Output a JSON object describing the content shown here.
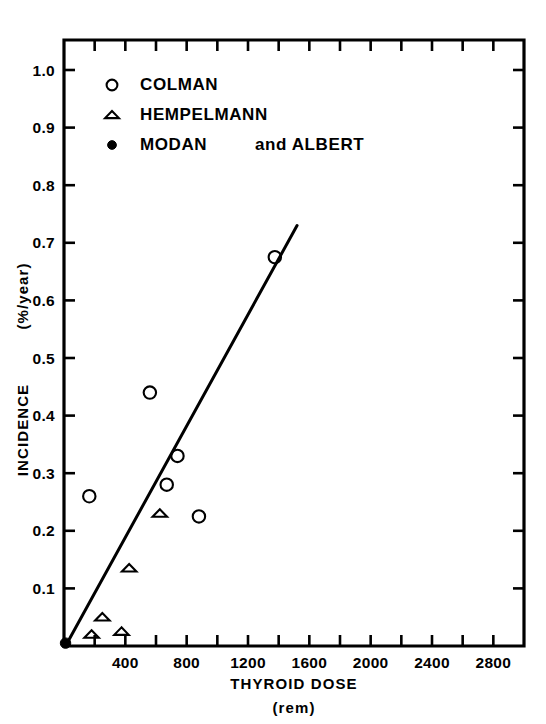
{
  "chart_data": {
    "type": "scatter",
    "title": "",
    "xlabel": "THYROID DOSE",
    "xlabel_units": "(rem)",
    "ylabel": "INCIDENCE",
    "ylabel_units": "(%/year)",
    "xlim": [
      0,
      3000
    ],
    "ylim": [
      0,
      1.05
    ],
    "xticks": [
      0,
      200,
      400,
      600,
      800,
      1000,
      1200,
      1400,
      1600,
      1800,
      2000,
      2200,
      2400,
      2600,
      2800,
      3000
    ],
    "xtick_labels": [
      "400",
      "800",
      "1200",
      "1600",
      "2000",
      "2400",
      "2800"
    ],
    "xtick_label_values": [
      400,
      800,
      1200,
      1600,
      2000,
      2400,
      2800
    ],
    "yticks": [
      0.1,
      0.2,
      0.3,
      0.4,
      0.5,
      0.6,
      0.7,
      0.8,
      0.9,
      1.0
    ],
    "ytick_labels": [
      "0.1",
      "0.2",
      "0.3",
      "0.4",
      "0.5",
      "0.6",
      "0.7",
      "0.8",
      "0.9",
      "1.0"
    ],
    "grid": false,
    "legend_position": "upper-left",
    "series": [
      {
        "name": "COLMAN",
        "marker": "open-circle",
        "points": [
          {
            "x": 165,
            "y": 0.26
          },
          {
            "x": 560,
            "y": 0.44
          },
          {
            "x": 670,
            "y": 0.28
          },
          {
            "x": 740,
            "y": 0.33
          },
          {
            "x": 880,
            "y": 0.225
          },
          {
            "x": 1375,
            "y": 0.675
          }
        ]
      },
      {
        "name": "HEMPELMANN",
        "marker": "open-triangle",
        "points": [
          {
            "x": 180,
            "y": 0.02
          },
          {
            "x": 250,
            "y": 0.05
          },
          {
            "x": 375,
            "y": 0.025
          },
          {
            "x": 425,
            "y": 0.135
          },
          {
            "x": 625,
            "y": 0.23
          }
        ]
      },
      {
        "name": "MODAN",
        "marker": "filled-dot",
        "points": [
          {
            "x": 10,
            "y": 0.005
          }
        ]
      }
    ],
    "trendline": {
      "x_start": 10,
      "y_start": 0.0,
      "x_end": 1520,
      "y_end": 0.73
    },
    "legend_entries": [
      {
        "marker": "open-circle",
        "label": "COLMAN"
      },
      {
        "marker": "open-triangle",
        "label": "HEMPELMANN"
      },
      {
        "marker": "filled-dot",
        "label": "MODAN",
        "label2": "and ALBERT"
      }
    ]
  },
  "colors": {
    "ink": "#000000",
    "paper": "#ffffff"
  }
}
